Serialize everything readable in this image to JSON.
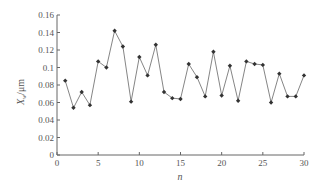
{
  "chart_data": {
    "type": "line",
    "title": "",
    "xlabel": "n",
    "ylabel": "X_w/μm",
    "ylabel_main": "X",
    "ylabel_sub": "w",
    "ylabel_unit": "/μm",
    "xlim": [
      0,
      30
    ],
    "ylim": [
      0,
      0.16
    ],
    "grid": false,
    "legend": null,
    "x_ticks": [
      0,
      5,
      10,
      15,
      20,
      25,
      30
    ],
    "x_tick_labels": [
      "0",
      "5",
      "10",
      "15",
      "20",
      "25",
      "30"
    ],
    "y_ticks": [
      0,
      0.02,
      0.04,
      0.06,
      0.08,
      0.1,
      0.12,
      0.14,
      0.16
    ],
    "y_tick_labels": [
      "0",
      "0.02",
      "0.04",
      "0.06",
      "0.08",
      "0.1",
      "0.12",
      "0.14",
      "0.16"
    ],
    "series": [
      {
        "name": "X_w",
        "marker": "diamond",
        "color": "#555555",
        "x": [
          1,
          2,
          3,
          4,
          5,
          6,
          7,
          8,
          9,
          10,
          11,
          12,
          13,
          14,
          15,
          16,
          17,
          18,
          19,
          20,
          21,
          22,
          23,
          24,
          25,
          26,
          27,
          28,
          29,
          30
        ],
        "values": [
          0.085,
          0.054,
          0.072,
          0.057,
          0.107,
          0.1,
          0.142,
          0.124,
          0.061,
          0.112,
          0.091,
          0.126,
          0.072,
          0.065,
          0.064,
          0.104,
          0.089,
          0.067,
          0.118,
          0.068,
          0.102,
          0.062,
          0.107,
          0.104,
          0.103,
          0.06,
          0.093,
          0.067,
          0.067,
          0.091
        ]
      }
    ]
  }
}
